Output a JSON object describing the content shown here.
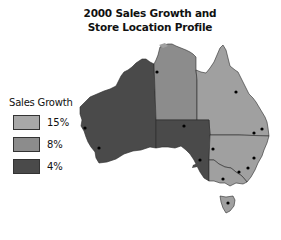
{
  "title": {
    "line1": "2000 Sales Growth and",
    "line2": "Store Location Profile"
  },
  "legend": {
    "title": "Sales Growth",
    "items": [
      {
        "label": "15%",
        "color": "#a8a8a8"
      },
      {
        "label": "8%",
        "color": "#8c8c8c"
      },
      {
        "label": "4%",
        "color": "#4a4a4a"
      }
    ]
  },
  "regions": [
    {
      "name": "Western Australia",
      "growth": "4%",
      "color": "#4a4a4a"
    },
    {
      "name": "Northern Territory",
      "growth": "8%",
      "color": "#8c8c8c"
    },
    {
      "name": "South Australia",
      "growth": "4%",
      "color": "#4a4a4a"
    },
    {
      "name": "Queensland",
      "growth": "8%",
      "color": "#8c8c8c"
    },
    {
      "name": "New South Wales",
      "growth": "8%",
      "color": "#8c8c8c"
    },
    {
      "name": "Victoria",
      "growth": "8%",
      "color": "#8c8c8c"
    },
    {
      "name": "Tasmania",
      "growth": "8%",
      "color": "#8c8c8c"
    }
  ],
  "store_locations_count": 14
}
